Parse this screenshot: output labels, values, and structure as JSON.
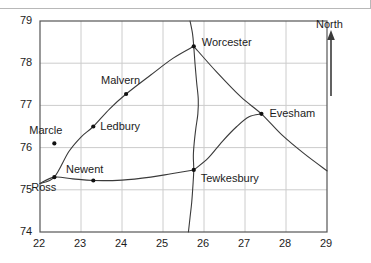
{
  "figure": {
    "compass_label": "North",
    "compass_icon": "north-arrow-icon"
  },
  "chart_data": {
    "type": "scatter",
    "title": "",
    "xlabel": "",
    "ylabel": "",
    "xlim": [
      22,
      29
    ],
    "ylim": [
      74,
      79
    ],
    "xticks": [
      "22",
      "23",
      "24",
      "25",
      "26",
      "27",
      "28",
      "29"
    ],
    "yticks": [
      "74",
      "75",
      "76",
      "77",
      "78",
      "79"
    ],
    "grid": true,
    "legend": null,
    "annotations": [
      "North"
    ],
    "points": [
      {
        "label": "Worcester",
        "x": 25.75,
        "y": 78.4
      },
      {
        "label": "Malvern",
        "x": 24.1,
        "y": 77.27
      },
      {
        "label": "Evesham",
        "x": 27.4,
        "y": 76.8
      },
      {
        "label": "Ledbury",
        "x": 23.3,
        "y": 76.5
      },
      {
        "label": "Marcle",
        "x": 22.35,
        "y": 76.1
      },
      {
        "label": "Tewkesbury",
        "x": 25.75,
        "y": 75.47
      },
      {
        "label": "Ross",
        "x": 22.35,
        "y": 75.3
      },
      {
        "label": "Newent",
        "x": 23.3,
        "y": 75.22
      }
    ],
    "routes": [
      {
        "name": "ross-ledbury-malvern-worcester",
        "points": [
          [
            22.0,
            75.15
          ],
          [
            22.35,
            75.3
          ],
          [
            22.7,
            75.9
          ],
          [
            23.0,
            76.25
          ],
          [
            23.3,
            76.5
          ],
          [
            23.7,
            76.92
          ],
          [
            24.1,
            77.27
          ],
          [
            24.7,
            77.72
          ],
          [
            25.25,
            78.12
          ],
          [
            25.75,
            78.4
          ]
        ]
      },
      {
        "name": "ross-newent-tewkesbury",
        "points": [
          [
            22.0,
            75.15
          ],
          [
            22.35,
            75.3
          ],
          [
            22.8,
            75.26
          ],
          [
            23.3,
            75.22
          ],
          [
            24.0,
            75.23
          ],
          [
            24.7,
            75.3
          ],
          [
            25.2,
            75.38
          ],
          [
            25.75,
            75.47
          ]
        ]
      },
      {
        "name": "worcester-evesham-east",
        "points": [
          [
            25.75,
            78.4
          ],
          [
            26.3,
            77.8
          ],
          [
            26.9,
            77.2
          ],
          [
            27.4,
            76.8
          ],
          [
            27.9,
            76.3
          ],
          [
            28.45,
            75.85
          ],
          [
            29.0,
            75.45
          ]
        ]
      },
      {
        "name": "tewkesbury-evesham",
        "points": [
          [
            25.75,
            75.47
          ],
          [
            26.1,
            75.75
          ],
          [
            26.45,
            76.15
          ],
          [
            26.8,
            76.5
          ],
          [
            27.1,
            76.73
          ],
          [
            27.4,
            76.8
          ]
        ]
      },
      {
        "name": "river-severn",
        "points": [
          [
            25.66,
            79.0
          ],
          [
            25.72,
            78.7
          ],
          [
            25.75,
            78.4
          ],
          [
            25.78,
            78.0
          ],
          [
            25.82,
            77.55
          ],
          [
            25.86,
            77.15
          ],
          [
            25.85,
            76.8
          ],
          [
            25.8,
            76.45
          ],
          [
            25.76,
            76.1
          ],
          [
            25.74,
            75.8
          ],
          [
            25.75,
            75.47
          ],
          [
            25.73,
            75.1
          ],
          [
            25.7,
            74.7
          ],
          [
            25.66,
            74.35
          ],
          [
            25.62,
            74.0
          ]
        ]
      }
    ],
    "label_offsets": {
      "Worcester": [
        8,
        -4
      ],
      "Malvern": [
        -14,
        -14
      ],
      "Evesham": [
        8,
        -1
      ],
      "Ledbury": [
        7,
        -1
      ],
      "Marcle": [
        -8,
        -13
      ],
      "Tewkesbury": [
        7,
        8
      ],
      "Ross": [
        -2,
        10
      ],
      "Newent": [
        -10,
        -12
      ]
    }
  }
}
